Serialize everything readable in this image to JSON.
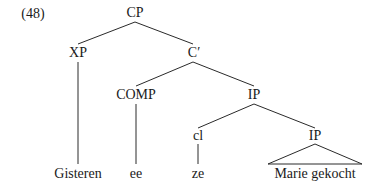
{
  "example_number": "(48)",
  "nodes": {
    "cp": "CP",
    "xp": "XP",
    "c_bar": "C′",
    "comp": "COMP",
    "ip_upper": "IP",
    "cl": "cl",
    "ip_lower": "IP"
  },
  "leaves": {
    "gisteren": "Gisteren",
    "ee": "ee",
    "ze": "ze",
    "marie_gekocht": "Marie gekocht"
  },
  "colors": {
    "ink": "#1a1a1a",
    "background": "#ffffff"
  }
}
